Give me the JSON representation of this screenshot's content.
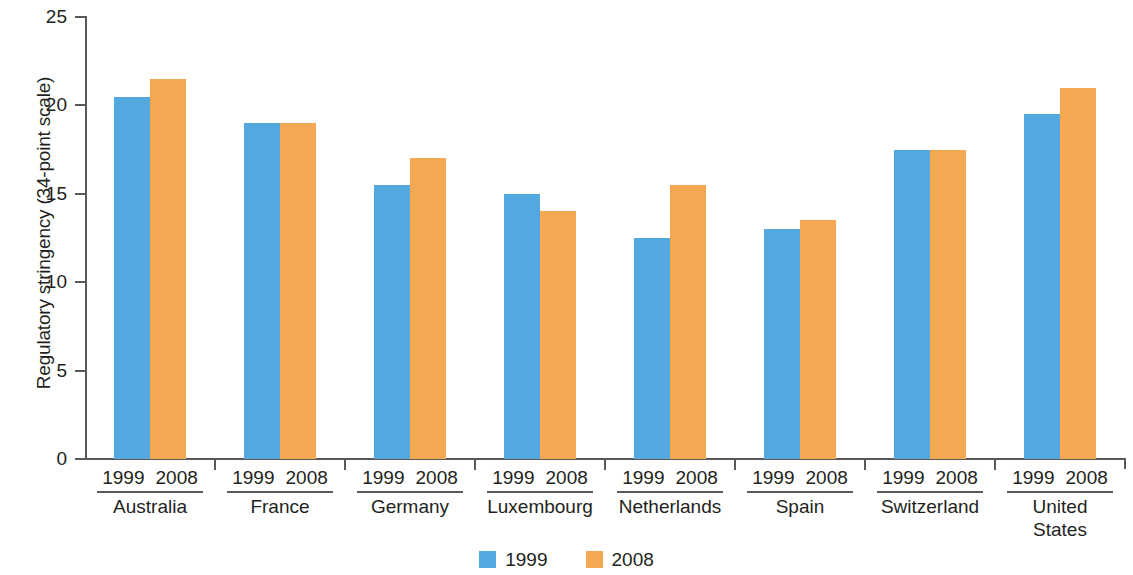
{
  "chart_data": {
    "type": "bar",
    "title": "",
    "subtitle": "",
    "xlabel": "",
    "ylabel": "Regulatory stringency (34-point scale)",
    "ylim": [
      0,
      25
    ],
    "ytick_labels": [
      "25",
      "20",
      "15",
      "10",
      "5",
      "0"
    ],
    "ytick_values": [
      25,
      20,
      15,
      10,
      5,
      0
    ],
    "grid": false,
    "legend_position": "bottom-center",
    "categories": [
      "Australia",
      "France",
      "Germany",
      "Luxembourg",
      "Netherlands",
      "Spain",
      "Switzerland",
      "United States"
    ],
    "category_display": [
      [
        "Australia"
      ],
      [
        "France"
      ],
      [
        "Germany"
      ],
      [
        "Luxembourg"
      ],
      [
        "Netherlands"
      ],
      [
        "Spain"
      ],
      [
        "Switzerland"
      ],
      [
        "United",
        "States"
      ]
    ],
    "group_tick_labels": [
      "1999",
      "2008"
    ],
    "series": [
      {
        "name": "1999",
        "color": "#54A8E0",
        "values": [
          20.5,
          19.0,
          15.5,
          15.0,
          12.5,
          13.0,
          17.5,
          19.5
        ]
      },
      {
        "name": "2008",
        "color": "#F4A851",
        "values": [
          21.5,
          19.0,
          17.0,
          14.0,
          15.5,
          13.5,
          17.5,
          21.0
        ]
      }
    ]
  },
  "legend": {
    "items": [
      {
        "label": "1999",
        "color": "#54A8E0"
      },
      {
        "label": "2008",
        "color": "#F4A851"
      }
    ]
  },
  "colors": {
    "series_1999": "#54A8E0",
    "series_2008": "#F4A851",
    "axis": "#58595b",
    "text": "#231f20",
    "background": "#ffffff"
  }
}
